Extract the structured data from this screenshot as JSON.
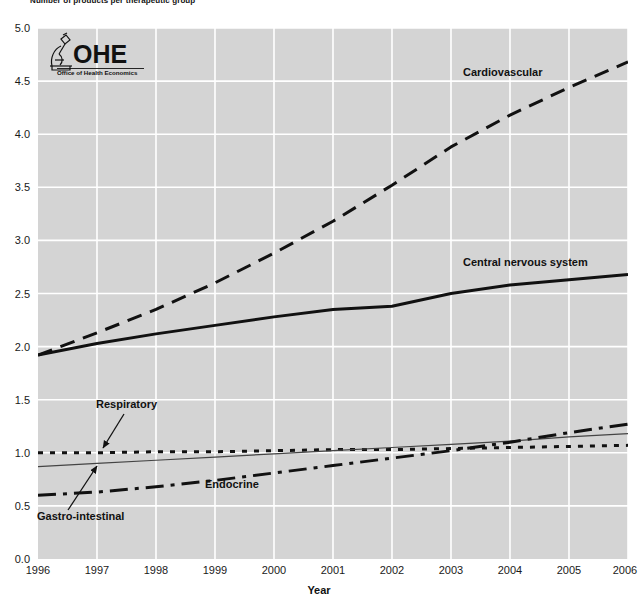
{
  "figure": {
    "title": "Number of products per therapeutic group",
    "logo": {
      "name": "OHE",
      "tagline": "Office of Health Economics",
      "icon": "microscope-icon"
    }
  },
  "chart_data": {
    "type": "line",
    "title": "Number of products per therapeutic group",
    "xlabel": "Year",
    "ylabel": "",
    "xlim": [
      1996,
      2006
    ],
    "ylim": [
      0.0,
      5.0
    ],
    "grid": true,
    "legend": "inline-annotations",
    "x": [
      1996,
      1997,
      1998,
      1999,
      2000,
      2001,
      2002,
      2003,
      2004,
      2005,
      2006
    ],
    "xticklabels": [
      "1996",
      "1997",
      "1998",
      "1999",
      "2000",
      "2001",
      "2002",
      "2003",
      "2004",
      "2005",
      "2006"
    ],
    "yticklabels": [
      "0.0",
      "0.5",
      "1.0",
      "1.5",
      "2.0",
      "2.5",
      "3.0",
      "3.5",
      "4.0",
      "4.5",
      "5.0"
    ],
    "yticks": [
      0.0,
      0.5,
      1.0,
      1.5,
      2.0,
      2.5,
      3.0,
      3.5,
      4.0,
      4.5,
      5.0
    ],
    "series": [
      {
        "name": "Cardiovascular",
        "style": "dashed",
        "width": 3,
        "color": "#111111",
        "values": [
          1.92,
          2.13,
          2.35,
          2.6,
          2.88,
          3.18,
          3.52,
          3.88,
          4.18,
          4.44,
          4.68
        ]
      },
      {
        "name": "Central nervous system",
        "style": "solid",
        "width": 3,
        "color": "#111111",
        "values": [
          1.92,
          2.03,
          2.12,
          2.2,
          2.28,
          2.35,
          2.38,
          2.5,
          2.58,
          2.63,
          2.68
        ]
      },
      {
        "name": "Respiratory",
        "style": "dotted",
        "width": 3,
        "color": "#111111",
        "values": [
          1.0,
          1.0,
          1.01,
          1.01,
          1.02,
          1.03,
          1.03,
          1.04,
          1.05,
          1.06,
          1.07
        ]
      },
      {
        "name": "Gastro-intestinal",
        "style": "thin-solid",
        "width": 1.2,
        "color": "#444444",
        "values": [
          0.87,
          0.9,
          0.93,
          0.96,
          0.99,
          1.02,
          1.05,
          1.08,
          1.11,
          1.15,
          1.18
        ]
      },
      {
        "name": "Endocrine",
        "style": "dash-dot",
        "width": 3,
        "color": "#111111",
        "values": [
          0.6,
          0.63,
          0.68,
          0.74,
          0.81,
          0.88,
          0.95,
          1.02,
          1.1,
          1.19,
          1.27
        ]
      }
    ],
    "annotations": [
      {
        "label": "Cardiovascular",
        "x_px": 463,
        "y_px": 73
      },
      {
        "label": "Central nervous system",
        "x_px": 463,
        "y_px": 263
      },
      {
        "label": "Respiratory",
        "x_px": 97,
        "y_px": 403
      },
      {
        "label": "Endocrine",
        "x_px": 205,
        "y_px": 483
      },
      {
        "label": "Gastro-intestinal",
        "x_px": 38,
        "y_px": 515
      }
    ]
  },
  "axes": {
    "x_label": "Year"
  }
}
